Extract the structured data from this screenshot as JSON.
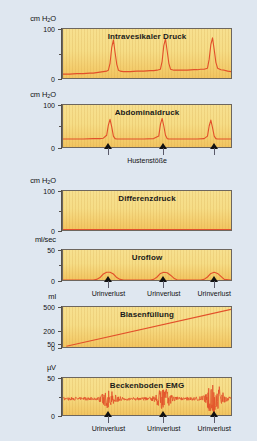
{
  "figure": {
    "background_color": "#dfe7f0",
    "panel_fill_top": "#f7e08f",
    "panel_fill_bottom": "#f2c45f",
    "trace_color": "#e2502a",
    "axis_color": "#55504a"
  },
  "chart_data": [
    {
      "type": "line",
      "title": "Intravesikaler Druck",
      "ylabel": "cm H₂O",
      "xlabel": "",
      "ylim": [
        0,
        100
      ],
      "yticks": [
        0,
        100
      ],
      "ytick_labels": [
        "0",
        "100"
      ],
      "minor_ticks": [
        50
      ],
      "grid": false,
      "annotations": [],
      "x": [
        0,
        4,
        8,
        12,
        16,
        18,
        20,
        22,
        24,
        26,
        27,
        28,
        29,
        30,
        31,
        32,
        33,
        34,
        36,
        40,
        44,
        48,
        52,
        54,
        56,
        58,
        59,
        60,
        61,
        62,
        63,
        64,
        66,
        70,
        74,
        78,
        80,
        82,
        84,
        86,
        87,
        88,
        89,
        90,
        91,
        92,
        94,
        96,
        98,
        100
      ],
      "values": [
        8,
        8,
        9,
        9,
        10,
        10,
        11,
        12,
        13,
        14,
        16,
        30,
        62,
        78,
        52,
        28,
        16,
        14,
        13,
        13,
        14,
        14,
        15,
        15,
        16,
        18,
        34,
        66,
        80,
        55,
        30,
        18,
        16,
        16,
        16,
        17,
        17,
        18,
        18,
        20,
        38,
        68,
        82,
        58,
        32,
        20,
        17,
        16,
        14,
        13
      ]
    },
    {
      "type": "line",
      "title": "Abdominaldruck",
      "ylabel": "cm H₂O",
      "xlabel": "Hustenstöße",
      "ylim": [
        0,
        100
      ],
      "yticks": [
        0,
        100
      ],
      "ytick_labels": [
        "0",
        "100"
      ],
      "minor_ticks": [
        50
      ],
      "grid": false,
      "annotations": [
        {
          "label": "Hustenstöße",
          "x_positions": [
            27,
            60,
            90
          ]
        }
      ],
      "x": [
        0,
        6,
        12,
        18,
        22,
        24,
        26,
        27,
        28,
        29,
        30,
        31,
        32,
        36,
        42,
        48,
        54,
        57,
        58,
        59,
        60,
        61,
        62,
        63,
        64,
        68,
        74,
        80,
        84,
        86,
        87,
        88,
        89,
        90,
        91,
        92,
        94,
        96,
        100
      ],
      "values": [
        19,
        19,
        19,
        20,
        20,
        21,
        28,
        52,
        66,
        48,
        26,
        20,
        19,
        19,
        19,
        19,
        20,
        26,
        54,
        68,
        50,
        28,
        20,
        19,
        19,
        19,
        19,
        19,
        20,
        26,
        50,
        64,
        46,
        26,
        20,
        19,
        19,
        19,
        19
      ]
    },
    {
      "type": "line",
      "title": "Differenzdruck",
      "ylabel": "cm H₂O",
      "xlabel": "",
      "ylim": [
        0,
        100
      ],
      "yticks": [
        0,
        100
      ],
      "ytick_labels": [
        "0",
        "100"
      ],
      "minor_ticks": [
        50
      ],
      "grid": false,
      "annotations": [],
      "x": [
        0,
        10,
        20,
        30,
        40,
        50,
        60,
        70,
        80,
        90,
        100
      ],
      "values": [
        1,
        1,
        1,
        1,
        1,
        1,
        1,
        1,
        1,
        1,
        1
      ]
    },
    {
      "type": "line",
      "title": "Uroflow",
      "ylabel": "ml/sec",
      "xlabel": "",
      "ylim": [
        0,
        50
      ],
      "yticks": [
        0,
        50
      ],
      "ytick_labels": [
        "0",
        "50"
      ],
      "minor_ticks": [
        25
      ],
      "grid": false,
      "annotations": [
        {
          "label": "Urinverlust",
          "x_positions": [
            27,
            60,
            90
          ]
        }
      ],
      "x": [
        0,
        10,
        18,
        20,
        22,
        24,
        26,
        28,
        30,
        32,
        34,
        36,
        44,
        52,
        54,
        56,
        58,
        60,
        62,
        64,
        66,
        68,
        76,
        82,
        84,
        86,
        88,
        90,
        92,
        94,
        96,
        100
      ],
      "values": [
        0,
        0,
        0,
        1,
        4,
        10,
        13,
        13,
        10,
        4,
        1,
        0,
        0,
        0,
        1,
        5,
        11,
        13,
        12,
        8,
        3,
        0,
        0,
        0,
        1,
        5,
        11,
        13,
        11,
        6,
        1,
        0
      ]
    },
    {
      "type": "line",
      "title": "Blasenfüllung",
      "ylabel": "ml",
      "xlabel": "",
      "ylim": [
        0,
        500
      ],
      "yticks": [
        0,
        50,
        200,
        500
      ],
      "ytick_labels": [
        "0",
        "50",
        "200",
        "500"
      ],
      "minor_ticks": [],
      "grid": false,
      "annotations": [],
      "x": [
        2,
        100
      ],
      "values": [
        10,
        470
      ]
    },
    {
      "type": "line",
      "title": "Beckenboden EMG",
      "ylabel": "µV",
      "xlabel": "",
      "ylim": [
        0,
        50
      ],
      "yticks": [
        0,
        50
      ],
      "ytick_labels": [
        "0",
        "50"
      ],
      "minor_ticks": [
        25
      ],
      "grid": false,
      "annotations": [
        {
          "label": "Urinverlust",
          "x_positions": [
            27,
            60,
            90
          ]
        }
      ],
      "baseline": 22,
      "bursts": [
        {
          "center": 27,
          "width": 11,
          "amplitude": 11
        },
        {
          "center": 60,
          "width": 11,
          "amplitude": 14
        },
        {
          "center": 90,
          "width": 12,
          "amplitude": 22
        }
      ],
      "noise_amplitude": 2.2
    }
  ]
}
